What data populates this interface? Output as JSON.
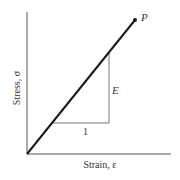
{
  "diagram": {
    "type": "stress-strain linear elastic",
    "x_axis_label": "Strain, ε",
    "y_axis_label": "Stress, σ",
    "point_label": "P",
    "slope_rise_label": "E",
    "slope_run_label": "1",
    "colors": {
      "line": "#1a1a1a",
      "axis": "#555555",
      "triangle": "#777777",
      "text": "#333333"
    }
  }
}
